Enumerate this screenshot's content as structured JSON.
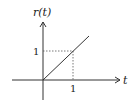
{
  "diagram": {
    "y_axis_label": "r(t)",
    "x_axis_label": "t",
    "x_tick_label": "1",
    "y_tick_label": "1",
    "line_color": "#333333",
    "guide_style": "dotted"
  }
}
